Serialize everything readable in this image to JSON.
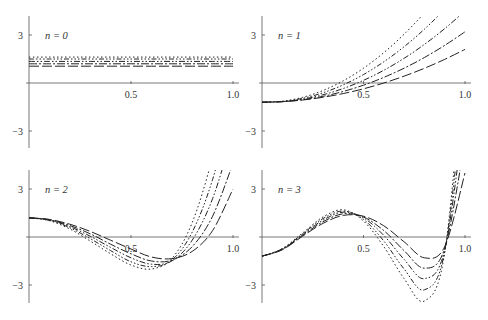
{
  "figure": {
    "width": 488,
    "height": 320,
    "line_color": "#222222",
    "axis_color": "#555555",
    "background": "#ffffff"
  },
  "chart_data": [
    {
      "type": "line",
      "title": "",
      "panel_label": "n = 0",
      "panel_label_var": "n",
      "panel_label_val": "0",
      "xlabel": "",
      "ylabel": "",
      "xlim": [
        0,
        1.0
      ],
      "ylim": [
        -4.1,
        4.2
      ],
      "xticks": [
        0.5,
        1.0
      ],
      "xtick_labels": [
        "0.5",
        "1.0"
      ],
      "yticks": [
        3,
        -3
      ],
      "ytick_labels": [
        "3",
        "−3"
      ],
      "grid": false,
      "legend": null,
      "x": [
        0,
        0.1,
        0.2,
        0.3,
        0.4,
        0.5,
        0.6,
        0.7,
        0.8,
        0.9,
        1.0
      ],
      "series": [
        {
          "name": "curve-1",
          "dash": "10,3",
          "values": [
            1.05,
            1.05,
            1.05,
            1.05,
            1.05,
            1.05,
            1.05,
            1.05,
            1.05,
            1.05,
            1.05
          ]
        },
        {
          "name": "curve-2",
          "dash": "8,2,2,2",
          "values": [
            1.2,
            1.2,
            1.2,
            1.2,
            1.2,
            1.2,
            1.2,
            1.2,
            1.2,
            1.2,
            1.2
          ]
        },
        {
          "name": "curve-3",
          "dash": "6,2,1.5,2,1.5,2",
          "values": [
            1.35,
            1.35,
            1.35,
            1.35,
            1.35,
            1.35,
            1.35,
            1.35,
            1.35,
            1.35,
            1.35
          ]
        },
        {
          "name": "curve-4",
          "dash": "5,2,1.5,2,1.5,2,1.5,2",
          "values": [
            1.5,
            1.5,
            1.5,
            1.5,
            1.5,
            1.5,
            1.5,
            1.5,
            1.5,
            1.5,
            1.5
          ]
        },
        {
          "name": "curve-5",
          "dash": "1.5,2.5",
          "values": [
            1.62,
            1.62,
            1.62,
            1.62,
            1.62,
            1.62,
            1.62,
            1.62,
            1.62,
            1.62,
            1.62
          ]
        }
      ]
    },
    {
      "type": "line",
      "title": "",
      "panel_label": "n = 1",
      "panel_label_var": "n",
      "panel_label_val": "1",
      "xlabel": "",
      "ylabel": "",
      "xlim": [
        0,
        1.0
      ],
      "ylim": [
        -4.1,
        4.2
      ],
      "xticks": [
        0.5,
        1.0
      ],
      "xtick_labels": [
        "0.5",
        "1.0"
      ],
      "yticks": [
        3,
        -3
      ],
      "ytick_labels": [
        "3",
        "−3"
      ],
      "grid": false,
      "legend": null,
      "x": [
        0,
        0.1,
        0.2,
        0.3,
        0.4,
        0.5,
        0.6,
        0.7,
        0.8,
        0.9,
        1.0
      ],
      "series": [
        {
          "name": "curve-1",
          "dash": "10,3",
          "values": [
            -1.2,
            -1.163,
            -1.065,
            -0.893,
            -0.66,
            -0.363,
            0.0,
            0.428,
            0.92,
            1.478,
            2.1
          ]
        },
        {
          "name": "curve-2",
          "dash": "8,2,2,2",
          "values": [
            -1.2,
            -1.169,
            -1.047,
            -0.834,
            -0.53,
            -0.136,
            0.349,
            0.926,
            1.593,
            2.351,
            3.2
          ]
        },
        {
          "name": "curve-3",
          "dash": "6,2,1.5,2,1.5,2",
          "values": [
            -1.2,
            -1.164,
            -1.01,
            -0.737,
            -0.345,
            0.166,
            0.795,
            1.543,
            2.41,
            3.396,
            4.5
          ]
        },
        {
          "name": "curve-4",
          "dash": "5,2,1.5,2,1.5,2,1.5,2",
          "values": [
            -1.2,
            -1.154,
            -0.958,
            -0.613,
            -0.117,
            0.528,
            1.323,
            2.268,
            3.362,
            4.606,
            6.0
          ]
        },
        {
          "name": "curve-5",
          "dash": "1.5,2.5",
          "values": [
            -1.2,
            -1.139,
            -0.896,
            -0.471,
            0.136,
            0.925,
            1.896,
            3.049,
            4.384,
            5.901,
            7.6
          ]
        }
      ]
    },
    {
      "type": "line",
      "title": "",
      "panel_label": "n = 2",
      "panel_label_var": "n",
      "panel_label_val": "2",
      "xlabel": "",
      "ylabel": "",
      "xlim": [
        0,
        1.0
      ],
      "ylim": [
        -4.1,
        4.2
      ],
      "xticks": [
        0.5,
        1.0
      ],
      "xtick_labels": [
        "0.5",
        "1.0"
      ],
      "yticks": [
        3,
        -3
      ],
      "ytick_labels": [
        "3",
        "−3"
      ],
      "grid": false,
      "legend": null,
      "x": [
        0,
        0.1,
        0.2,
        0.3,
        0.4,
        0.5,
        0.6,
        0.7,
        0.8,
        0.9,
        1.0
      ],
      "series": [
        {
          "name": "curve-1",
          "dash": "10,3",
          "values": [
            1.2,
            1.1,
            0.8,
            0.35,
            -0.2,
            -0.75,
            -1.25,
            -1.35,
            -0.9,
            0.4,
            3.0
          ]
        },
        {
          "name": "curve-2",
          "dash": "8,2,2,2",
          "values": [
            1.2,
            1.08,
            0.72,
            0.2,
            -0.45,
            -1.05,
            -1.5,
            -1.45,
            -0.6,
            1.3,
            4.6
          ]
        },
        {
          "name": "curve-3",
          "dash": "6,2,1.5,2,1.5,2",
          "values": [
            1.2,
            1.06,
            0.65,
            0.05,
            -0.65,
            -1.3,
            -1.7,
            -1.5,
            -0.2,
            2.4,
            6.5
          ]
        },
        {
          "name": "curve-4",
          "dash": "5,2,1.5,2,1.5,2,1.5,2",
          "values": [
            1.2,
            1.04,
            0.58,
            -0.1,
            -0.85,
            -1.55,
            -1.85,
            -1.45,
            0.3,
            3.6,
            8.5
          ]
        },
        {
          "name": "curve-5",
          "dash": "1.5,2.5",
          "values": [
            1.2,
            1.02,
            0.5,
            -0.25,
            -1.05,
            -1.75,
            -2.0,
            -1.35,
            0.9,
            5.0,
            10.5
          ]
        }
      ]
    },
    {
      "type": "line",
      "title": "",
      "panel_label": "n = 3",
      "panel_label_var": "n",
      "panel_label_val": "3",
      "xlabel": "",
      "ylabel": "",
      "xlim": [
        0,
        1.0
      ],
      "ylim": [
        -4.1,
        4.2
      ],
      "xticks": [
        0.5,
        1.0
      ],
      "xtick_labels": [
        "0.5",
        "1.0"
      ],
      "yticks": [
        3,
        -3
      ],
      "ytick_labels": [
        "3",
        "−3"
      ],
      "grid": false,
      "legend": null,
      "x": [
        0,
        0.1,
        0.2,
        0.3,
        0.4,
        0.5,
        0.6,
        0.7,
        0.8,
        0.9,
        1.0
      ],
      "series": [
        {
          "name": "curve-1",
          "dash": "10,3",
          "values": [
            -1.2,
            -0.8,
            0.05,
            0.85,
            1.35,
            1.3,
            0.7,
            -0.3,
            -1.3,
            -0.6,
            4.0
          ]
        },
        {
          "name": "curve-2",
          "dash": "8,2,2,2",
          "values": [
            -1.2,
            -0.78,
            0.1,
            0.95,
            1.45,
            1.25,
            0.4,
            -0.85,
            -1.95,
            -0.7,
            6.0
          ]
        },
        {
          "name": "curve-3",
          "dash": "6,2,1.5,2,1.5,2",
          "values": [
            -1.2,
            -0.76,
            0.15,
            1.05,
            1.55,
            1.2,
            0.1,
            -1.4,
            -2.6,
            -0.8,
            8.0
          ]
        },
        {
          "name": "curve-4",
          "dash": "5,2,1.5,2,1.5,2,1.5,2",
          "values": [
            -1.2,
            -0.74,
            0.2,
            1.15,
            1.62,
            1.1,
            -0.25,
            -2.0,
            -3.3,
            -0.9,
            10.0
          ]
        },
        {
          "name": "curve-5",
          "dash": "1.5,2.5",
          "values": [
            -1.2,
            -0.72,
            0.25,
            1.25,
            1.7,
            1.0,
            -0.6,
            -2.6,
            -4.0,
            -1.0,
            12.0
          ]
        }
      ]
    }
  ],
  "layout": {
    "panels": [
      {
        "x0": 29,
        "x1": 233,
        "y0": 83,
        "ppu_y": 16,
        "top": 16,
        "bottom": 148
      },
      {
        "x0": 262,
        "x1": 465,
        "y0": 83,
        "ppu_y": 16,
        "top": 16,
        "bottom": 148
      },
      {
        "x0": 29,
        "x1": 233,
        "y0": 237,
        "ppu_y": 16,
        "top": 170,
        "bottom": 303
      },
      {
        "x0": 262,
        "x1": 465,
        "y0": 237,
        "ppu_y": 16,
        "top": 170,
        "bottom": 303
      }
    ]
  }
}
